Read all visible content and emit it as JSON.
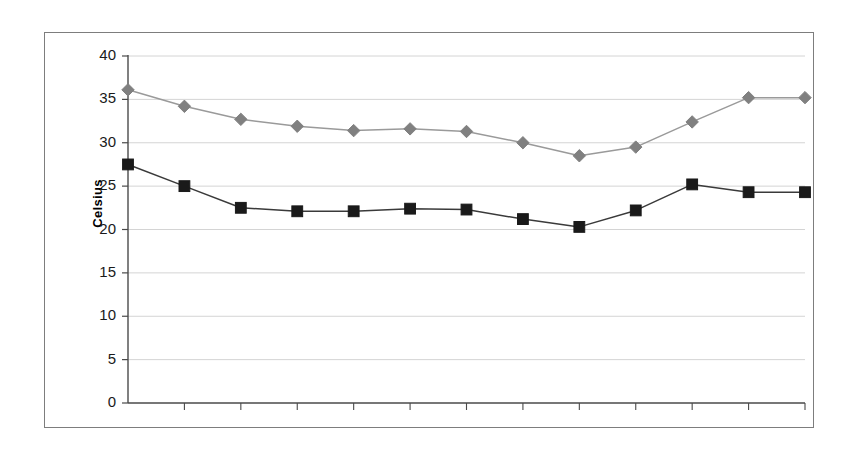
{
  "chart_data": {
    "type": "line",
    "title": "",
    "subtitle": "",
    "xlabel": "",
    "ylabel": "Celsius",
    "ylim": [
      0,
      40
    ],
    "y_ticks": [
      0,
      5,
      10,
      15,
      20,
      25,
      30,
      35,
      40
    ],
    "y_tick_labels": [
      "0",
      "5",
      "10",
      "15",
      "20",
      "25",
      "30",
      "35",
      "40"
    ],
    "grid": true,
    "grid_axis": "y",
    "legend": "none",
    "x_tick_labels": [
      "",
      "",
      "",
      "",
      "",
      "",
      "",
      "",
      "",
      "",
      "",
      "",
      ""
    ],
    "categories": [
      1,
      2,
      3,
      4,
      5,
      6,
      7,
      8,
      9,
      10,
      11,
      12,
      13
    ],
    "series": [
      {
        "name": "maximum-temperature",
        "marker": "diamond",
        "color": "#808080",
        "line_color": "#9a9a9a",
        "values": [
          36.1,
          34.2,
          32.7,
          31.9,
          31.4,
          31.6,
          31.3,
          30.0,
          28.5,
          29.5,
          32.4,
          35.2,
          35.2
        ]
      },
      {
        "name": "minimum-temperature",
        "marker": "square",
        "color": "#1a1a1a",
        "line_color": "#3a3a3a",
        "values": [
          27.5,
          25.0,
          22.5,
          22.1,
          22.1,
          22.4,
          22.3,
          21.2,
          20.3,
          22.2,
          25.2,
          24.3,
          24.3
        ]
      }
    ]
  },
  "colors": {
    "frame": "#7d7d7d",
    "axis": "#4a4a4a",
    "gridline": "#d4d4d4",
    "background": "#ffffff",
    "series_gray": "#808080",
    "series_dark": "#1a1a1a"
  }
}
